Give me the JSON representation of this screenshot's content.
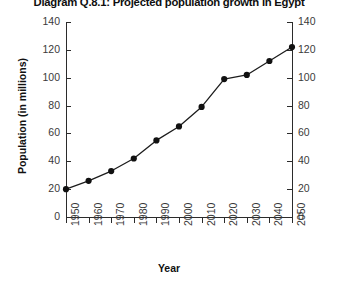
{
  "chart_data": {
    "type": "line",
    "title": "Diagram Q.8.1: Projected population growth in Egypt",
    "subtitle": "",
    "xlabel": "Year",
    "ylabel": "Population (in millions)",
    "x": [
      1950,
      1960,
      1970,
      1980,
      1990,
      2000,
      2010,
      2020,
      2030,
      2040,
      2050
    ],
    "categories": [
      "1950",
      "1960",
      "1970",
      "1980",
      "1990",
      "2000",
      "2010",
      "2020",
      "2030",
      "2040",
      "2050"
    ],
    "values": [
      20,
      26,
      33,
      42,
      55,
      65,
      79,
      99,
      102,
      112,
      122
    ],
    "series": [
      {
        "name": "Population",
        "values": [
          20,
          26,
          33,
          42,
          55,
          65,
          79,
          99,
          102,
          112,
          122
        ]
      }
    ],
    "xlim": [
      1950,
      2050
    ],
    "ylim": [
      0,
      140
    ],
    "ytick_labels": [
      "0",
      "20",
      "40",
      "60",
      "80",
      "100",
      "120",
      "140"
    ],
    "ytick_values": [
      0,
      20,
      40,
      60,
      80,
      100,
      120,
      140
    ],
    "xtick_labels": [
      "1950",
      "1960",
      "1970",
      "1980",
      "1990",
      "2000",
      "2010",
      "2020",
      "2030",
      "2040",
      "2050"
    ],
    "right_axis": {
      "visible": true,
      "tick_labels": [
        "0",
        "20",
        "40",
        "60",
        "80",
        "100",
        "120",
        "140"
      ]
    },
    "grid": false,
    "legend": null,
    "legend_position": "none",
    "marker": "filled-circle",
    "line_color": "#1c1c1c",
    "marker_color": "#111111",
    "axis_color": "#2b2b2b",
    "background_color": "#ffffff"
  }
}
